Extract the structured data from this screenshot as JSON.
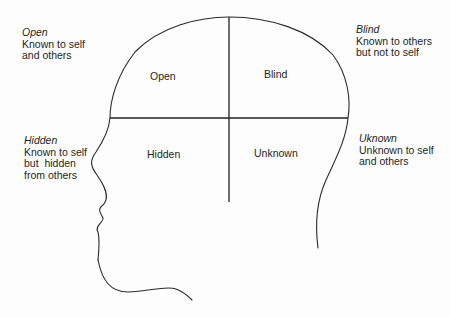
{
  "diagram": {
    "type": "johari-window-head",
    "colors": {
      "background": "#fdfdfd",
      "stroke": "#2a2a2a",
      "text": "#1e1e1e"
    },
    "quadrants": [
      {
        "id": "open",
        "label": "Open"
      },
      {
        "id": "blind",
        "label": "Blind"
      },
      {
        "id": "hidden",
        "label": "Hidden"
      },
      {
        "id": "unknown",
        "label": "Unknown"
      }
    ],
    "annotations": [
      {
        "id": "open",
        "title": "Open",
        "lines": [
          "Known to self",
          "and others"
        ]
      },
      {
        "id": "blind",
        "title": "Blind",
        "lines": [
          "Known to others",
          "but not to self"
        ]
      },
      {
        "id": "hidden",
        "title": "Hidden",
        "lines": [
          "Known to self",
          "but  hidden",
          "from others"
        ]
      },
      {
        "id": "unknown",
        "title": "Uknown",
        "lines": [
          "Unknown to self",
          "and others"
        ]
      }
    ]
  }
}
